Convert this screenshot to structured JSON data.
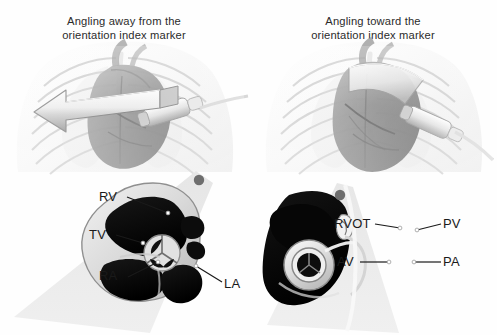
{
  "figure": {
    "background_color": "#fefefe",
    "label_text_color": "#1a1a1a",
    "caption_text_color": "#2b2b2b"
  },
  "panels": [
    {
      "id": "panel-left",
      "caption_line1": "Angling away from the",
      "caption_line2": "orientation index marker",
      "torso": {
        "name": "chest-ribcage-heart-probe-illustration",
        "arrow_direction": "left",
        "arrow_label": "angling-away-arrow"
      },
      "sector": {
        "name": "ultrasound-sector-four-chamber",
        "orientation_marker": "orientation-index-marker-dot"
      },
      "labels": [
        {
          "id": "RV",
          "text": "RV",
          "x": 100,
          "y": 190,
          "lx1": 127,
          "ly1": 197,
          "lx2": 168,
          "ly2": 213
        },
        {
          "id": "TV",
          "text": "TV",
          "x": 90,
          "y": 228,
          "lx1": 116,
          "ly1": 235,
          "lx2": 143,
          "ly2": 243
        },
        {
          "id": "RA",
          "text": "RA",
          "x": 100,
          "y": 274,
          "lx1": 128,
          "ly1": 277,
          "lx2": 158,
          "ly2": 262
        },
        {
          "id": "LA",
          "text": "LA",
          "x": 224,
          "y": 283,
          "lx1": 222,
          "ly1": 282,
          "lx2": 196,
          "ly2": 266
        }
      ]
    },
    {
      "id": "panel-right",
      "caption_line1": "Angling toward the",
      "caption_line2": "orientation index marker",
      "torso": {
        "name": "chest-ribcage-heart-probe-illustration",
        "arrow_direction": "none",
        "arrow_label": "scan-plane-ribbon"
      },
      "sector": {
        "name": "ultrasound-sector-rvot-short-axis",
        "orientation_marker": "orientation-index-marker-dot"
      },
      "labels": [
        {
          "id": "RVOT",
          "text": "RVOT",
          "x": 334,
          "y": 218,
          "lx1": 375,
          "ly1": 224,
          "lx2": 400,
          "ly2": 228
        },
        {
          "id": "PV",
          "text": "PV",
          "x": 443,
          "y": 218,
          "lx1": 441,
          "ly1": 224,
          "lx2": 417,
          "ly2": 230
        },
        {
          "id": "AV",
          "text": "AV",
          "x": 337,
          "y": 256,
          "lx1": 360,
          "ly1": 262,
          "lx2": 389,
          "ly2": 262
        },
        {
          "id": "PA",
          "text": "PA",
          "x": 443,
          "y": 256,
          "lx1": 441,
          "ly1": 262,
          "lx2": 414,
          "ly2": 262
        }
      ]
    }
  ]
}
